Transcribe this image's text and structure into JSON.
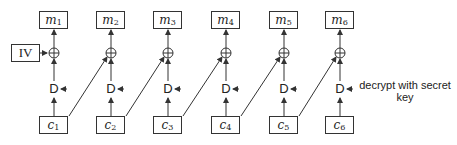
{
  "diagram": {
    "iv_label": "IV",
    "decrypt_label": "D",
    "annotation": "decrypt with secret key",
    "columns": [
      {
        "plaintext": "m",
        "plaintext_sub": "1",
        "ciphertext": "c",
        "ciphertext_sub": "1"
      },
      {
        "plaintext": "m",
        "plaintext_sub": "2",
        "ciphertext": "c",
        "ciphertext_sub": "2"
      },
      {
        "plaintext": "m",
        "plaintext_sub": "3",
        "ciphertext": "c",
        "ciphertext_sub": "3"
      },
      {
        "plaintext": "m",
        "plaintext_sub": "4",
        "ciphertext": "c",
        "ciphertext_sub": "4"
      },
      {
        "plaintext": "m",
        "plaintext_sub": "5",
        "ciphertext": "c",
        "ciphertext_sub": "5"
      },
      {
        "plaintext": "m",
        "plaintext_sub": "6",
        "ciphertext": "c",
        "ciphertext_sub": "6"
      }
    ],
    "xor_symbol": "⊕",
    "line_color": "#333333"
  }
}
